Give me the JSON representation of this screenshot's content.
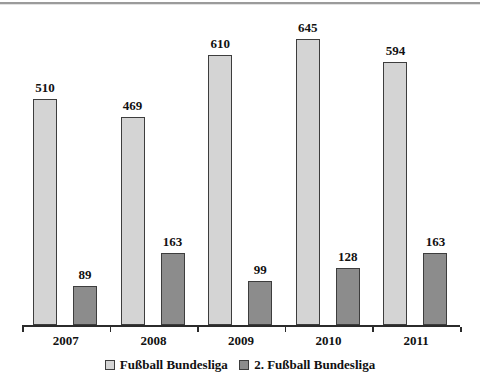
{
  "chart_data": {
    "type": "bar",
    "title": "",
    "xlabel": "",
    "ylabel": "",
    "categories": [
      "2007",
      "2008",
      "2009",
      "2010",
      "2011"
    ],
    "series": [
      {
        "name": "Fußball Bundesliga",
        "values": [
          510,
          469,
          610,
          645,
          594
        ],
        "color": "#d4d4d4"
      },
      {
        "name": "2. Fußball Bundesliga",
        "values": [
          89,
          163,
          99,
          128,
          163
        ],
        "color": "#8c8c8c"
      }
    ],
    "ylim": [
      0,
      700
    ],
    "grid": false,
    "legend_position": "bottom",
    "data_labels": true,
    "bar_border_color": "#3d3d3d",
    "axis_color": "#2b2b2b"
  }
}
